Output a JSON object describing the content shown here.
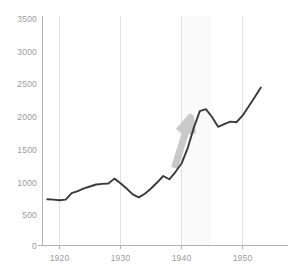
{
  "chart_data": {
    "type": "line",
    "title": "",
    "subtitle": "",
    "xlabel": "",
    "ylabel": "",
    "xlim": [
      1918,
      1953
    ],
    "ylim": [
      0,
      3500
    ],
    "grid": "vertical",
    "legend": "none",
    "accent_color": "#3a3a3a",
    "annotation_color": "#c9c9c9",
    "grid_color": "#e2e2e6",
    "axis_color": "#b3b3b3",
    "tick_label_color": "#9a9a9a",
    "x_ticks": [
      1920,
      1930,
      1940,
      1950
    ],
    "x_tick_labels": [
      "1920",
      "1930",
      "1940",
      "1950"
    ],
    "y_ticks": [
      0,
      500,
      1000,
      1500,
      2000,
      2500,
      3000,
      3500
    ],
    "y_tick_labels": [
      "0",
      "500",
      "1000",
      "1500",
      "2000",
      "2500",
      "3000",
      "3500"
    ],
    "series": [
      {
        "name": "value",
        "x": [
          1918,
          1919,
          1920,
          1921,
          1922,
          1923,
          1924,
          1925,
          1926,
          1927,
          1928,
          1929,
          1930,
          1931,
          1932,
          1933,
          1934,
          1935,
          1936,
          1937,
          1938,
          1939,
          1940,
          1941,
          1942,
          1943,
          1944,
          1945,
          1946,
          1947,
          1948,
          1949,
          1950,
          1951,
          1952,
          1953
        ],
        "y": [
          705,
          700,
          690,
          700,
          800,
          830,
          870,
          900,
          930,
          940,
          945,
          1020,
          950,
          870,
          780,
          735,
          790,
          870,
          960,
          1060,
          1010,
          1120,
          1250,
          1480,
          1790,
          2050,
          2080,
          1960,
          1810,
          1850,
          1890,
          1880,
          1980,
          2120,
          2260,
          2410
        ]
      }
    ],
    "annotations": [
      {
        "name": "growth-arrow",
        "kind": "arrow",
        "x_start": 1940.0,
        "y_start": 1200,
        "x_end": 1941.2,
        "y_end": 2100,
        "color": "#c9c9c9"
      }
    ]
  }
}
